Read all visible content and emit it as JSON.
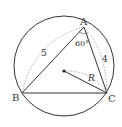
{
  "diagram": {
    "type": "triangle-inscribed-in-circle",
    "vertices": {
      "A": {
        "label": "A",
        "x": 84,
        "y": 27
      },
      "B": {
        "label": "B",
        "x": 22,
        "y": 93
      },
      "C": {
        "label": "C",
        "x": 107,
        "y": 93
      }
    },
    "circle": {
      "cx": 64,
      "cy": 71,
      "r": 50
    },
    "center_point": {
      "x": 64,
      "y": 71
    },
    "labels": {
      "A": "A",
      "B": "B",
      "C": "C",
      "side_AB": "5",
      "side_AC": "4",
      "angle_A": "60°",
      "radius": "R"
    },
    "colors": {
      "stroke": "#333333",
      "dashed": "#999999"
    }
  }
}
